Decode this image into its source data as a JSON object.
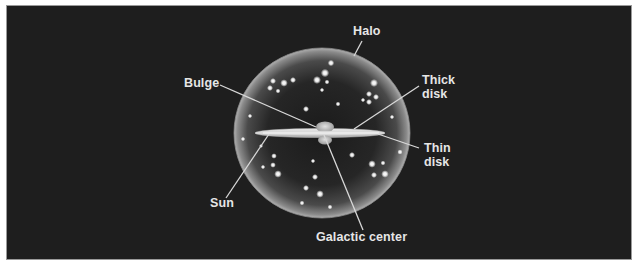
{
  "diagram": {
    "background_color": "#1e1e1e",
    "labels": {
      "halo": "Halo",
      "bulge": "Bulge",
      "thick_disk_line1": "Thick",
      "thick_disk_line2": "disk",
      "thin_disk_line1": "Thin",
      "thin_disk_line2": "disk",
      "sun": "Sun",
      "galactic_center": "Galactic center"
    },
    "components": [
      {
        "name": "Halo",
        "shape": "sphere",
        "description": "spherical halo containing scattered stars and globular clusters"
      },
      {
        "name": "Bulge",
        "shape": "central bulge"
      },
      {
        "name": "Thick disk",
        "shape": "disk"
      },
      {
        "name": "Thin disk",
        "shape": "disk"
      },
      {
        "name": "Sun",
        "shape": "point in disk"
      },
      {
        "name": "Galactic center",
        "shape": "point"
      }
    ],
    "colors": {
      "label_text": "#e6e6e6",
      "leader_line": "#d8d8d8",
      "halo_edge": "#bdbdbd",
      "disk": "#d9d9d9",
      "star": "#ffffff"
    }
  }
}
